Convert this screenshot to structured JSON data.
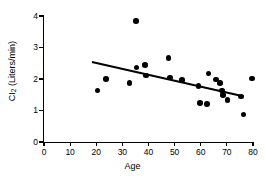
{
  "chart_data": {
    "type": "scatter",
    "title": "",
    "xlabel": "Age",
    "ylabel": "CI (Liters/min)",
    "ylabel_base": "CI",
    "ylabel_sub": "2",
    "ylabel_unit": " (Liters/min)",
    "xlim": [
      0,
      80
    ],
    "ylim": [
      0,
      4
    ],
    "xticks": [
      0,
      10,
      20,
      30,
      40,
      50,
      60,
      70,
      80
    ],
    "yticks": [
      0,
      1,
      2,
      3,
      4
    ],
    "grid": false,
    "legend": null,
    "marker": "filled-circle",
    "marker_color": "#000000",
    "points": [
      {
        "x": 20.5,
        "y": 1.63
      },
      {
        "x": 23.8,
        "y": 2.0
      },
      {
        "x": 32.7,
        "y": 1.88
      },
      {
        "x": 35.2,
        "y": 3.84
      },
      {
        "x": 35.4,
        "y": 2.37
      },
      {
        "x": 38.6,
        "y": 2.45
      },
      {
        "x": 39.0,
        "y": 2.11
      },
      {
        "x": 47.6,
        "y": 2.66
      },
      {
        "x": 48.2,
        "y": 2.05
      },
      {
        "x": 52.9,
        "y": 1.96
      },
      {
        "x": 59.2,
        "y": 1.77
      },
      {
        "x": 59.8,
        "y": 1.24
      },
      {
        "x": 62.4,
        "y": 1.21
      },
      {
        "x": 62.9,
        "y": 2.18
      },
      {
        "x": 65.9,
        "y": 1.98
      },
      {
        "x": 67.4,
        "y": 1.88
      },
      {
        "x": 68.2,
        "y": 1.63
      },
      {
        "x": 68.6,
        "y": 1.5
      },
      {
        "x": 70.2,
        "y": 1.33
      },
      {
        "x": 75.3,
        "y": 1.45
      },
      {
        "x": 76.4,
        "y": 0.87
      },
      {
        "x": 79.6,
        "y": 2.02
      }
    ],
    "regression_line": {
      "x_start": 18.5,
      "y_start": 2.58,
      "x_end": 76.5,
      "y_end": 1.49
    }
  }
}
